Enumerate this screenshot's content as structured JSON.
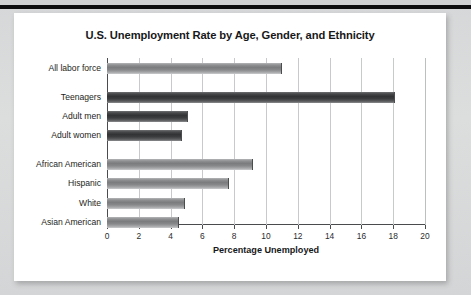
{
  "chart_data": {
    "type": "bar",
    "orientation": "horizontal",
    "title": "U.S. Unemployment Rate by Age, Gender, and Ethnicity",
    "xlabel": "Percentage Unemployed",
    "ylabel": "",
    "xlim": [
      0,
      20
    ],
    "xticks": [
      0,
      2,
      4,
      6,
      8,
      10,
      12,
      14,
      16,
      18,
      20
    ],
    "xtick_labels": [
      "0",
      "2",
      "4",
      "6",
      "8",
      "10",
      "12",
      "14",
      "16",
      "18",
      "20"
    ],
    "grid": "vertical",
    "legend": "none",
    "categories": [
      "All labor force",
      "Teenagers",
      "Adult men",
      "Adult women",
      "African American",
      "Hispanic",
      "White",
      "Asian American"
    ],
    "values": [
      11.0,
      18.1,
      5.1,
      4.7,
      9.2,
      7.7,
      4.9,
      4.5
    ],
    "bars": [
      {
        "label": "All labor force",
        "value": 11.0,
        "shade": "light",
        "group": 1
      },
      {
        "label": "Teenagers",
        "value": 18.1,
        "shade": "dark",
        "group": 2
      },
      {
        "label": "Adult men",
        "value": 5.1,
        "shade": "dark",
        "group": 2
      },
      {
        "label": "Adult women",
        "value": 4.7,
        "shade": "dark",
        "group": 2
      },
      {
        "label": "African American",
        "value": 9.2,
        "shade": "light",
        "group": 3
      },
      {
        "label": "Hispanic",
        "value": 7.7,
        "shade": "light",
        "group": 3
      },
      {
        "label": "White",
        "value": 4.9,
        "shade": "light",
        "group": 3
      },
      {
        "label": "Asian American",
        "value": 4.5,
        "shade": "light",
        "group": 3
      }
    ],
    "colors": {
      "bar_light": "#8f9091",
      "bar_dark": "#3a3b3d",
      "axis": "#4a4b4d",
      "gridline": "#c8c9ca",
      "text": "#1d1e20",
      "card_background": "#ffffff",
      "page_background": "#d9dadb",
      "top_rule": "#0d0d0f"
    }
  }
}
